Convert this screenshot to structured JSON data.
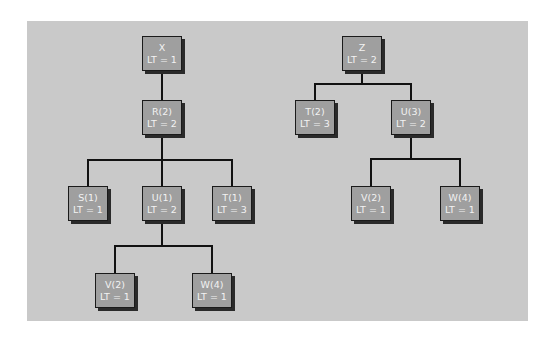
{
  "diagram": {
    "type": "tree",
    "colors": {
      "background": "#ffffff",
      "panel": "#c9c9c9",
      "node_fill": "#9f9f9f",
      "node_border": "#1a1a1a",
      "node_shadow": "#2a2a2a",
      "node_text": "#f2f2f2",
      "edge": "#111111"
    },
    "trees": [
      {
        "root": "X",
        "nodes": [
          {
            "id": "x",
            "name": "X",
            "lt": "LT = 1"
          },
          {
            "id": "r",
            "name": "R(2)",
            "lt": "LT = 2"
          },
          {
            "id": "s",
            "name": "S(1)",
            "lt": "LT = 1"
          },
          {
            "id": "u",
            "name": "U(1)",
            "lt": "LT = 2"
          },
          {
            "id": "t",
            "name": "T(1)",
            "lt": "LT = 3"
          },
          {
            "id": "v",
            "name": "V(2)",
            "lt": "LT = 1"
          },
          {
            "id": "w",
            "name": "W(4)",
            "lt": "LT = 1"
          }
        ],
        "edges": [
          [
            "X",
            "R(2)"
          ],
          [
            "R(2)",
            "S(1)"
          ],
          [
            "R(2)",
            "U(1)"
          ],
          [
            "R(2)",
            "T(1)"
          ],
          [
            "U(1)",
            "V(2)"
          ],
          [
            "U(1)",
            "W(4)"
          ]
        ]
      },
      {
        "root": "Z",
        "nodes": [
          {
            "id": "z",
            "name": "Z",
            "lt": "LT = 2"
          },
          {
            "id": "t2",
            "name": "T(2)",
            "lt": "LT = 3"
          },
          {
            "id": "u3",
            "name": "U(3)",
            "lt": "LT = 2"
          },
          {
            "id": "v2",
            "name": "V(2)",
            "lt": "LT = 1"
          },
          {
            "id": "w4",
            "name": "W(4)",
            "lt": "LT = 1"
          }
        ],
        "edges": [
          [
            "Z",
            "T(2)"
          ],
          [
            "Z",
            "U(3)"
          ],
          [
            "U(3)",
            "V(2)"
          ],
          [
            "U(3)",
            "W(4)"
          ]
        ]
      }
    ]
  }
}
